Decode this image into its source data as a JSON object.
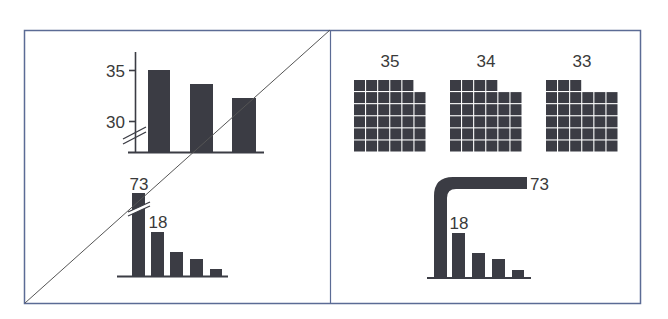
{
  "colors": {
    "frame": "#5b6b95",
    "bar": "#3b3c44",
    "text": "#3a3a3a",
    "diagonal": "#555555",
    "background": "#ffffff"
  },
  "panels": {
    "left": {
      "label": "crossed-out (bad) examples",
      "top_chart": {
        "y_ticks": [
          "35",
          "30"
        ],
        "values": [
          35,
          33.6,
          32.2
        ],
        "axis_break": true
      },
      "bottom_chart": {
        "label_big": "73",
        "label_second": "18",
        "values": [
          73,
          18,
          9,
          7,
          3
        ],
        "axis_break": true
      }
    },
    "right": {
      "label": "recommended alternatives",
      "waffles": [
        {
          "label": "35",
          "value": 35,
          "top_row_cells": 5
        },
        {
          "label": "34",
          "value": 34,
          "top_row_cells": 4
        },
        {
          "label": "33",
          "value": 33,
          "top_row_cells": 3
        }
      ],
      "bent_chart": {
        "label_big": "73",
        "label_second": "18",
        "values": [
          73,
          18,
          9,
          7,
          3
        ]
      }
    }
  },
  "chart_data": [
    {
      "type": "bar",
      "title": "",
      "categories": [
        "A",
        "B",
        "C"
      ],
      "values": [
        35,
        33.6,
        32.2
      ],
      "yticks": [
        30,
        35
      ],
      "ylim": [
        27,
        37
      ],
      "axis_break": true,
      "annotation": "Truncated y-axis with break marks (crossed out)"
    },
    {
      "type": "bar",
      "title": "",
      "categories": [
        "1",
        "2",
        "3",
        "4",
        "5"
      ],
      "values": [
        73,
        18,
        9,
        7,
        3
      ],
      "data_labels": [
        "73",
        "18"
      ],
      "annotation": "Broken first bar (crossed out)"
    },
    {
      "type": "waffle",
      "categories": [
        "35",
        "34",
        "33"
      ],
      "values": [
        35,
        34,
        33
      ],
      "grid": "6x6 unit squares"
    },
    {
      "type": "bar",
      "categories": [
        "1",
        "2",
        "3",
        "4",
        "5"
      ],
      "values": [
        73,
        18,
        9,
        7,
        3
      ],
      "data_labels": [
        "73",
        "18"
      ],
      "annotation": "First bar bent horizontally to fit"
    }
  ]
}
